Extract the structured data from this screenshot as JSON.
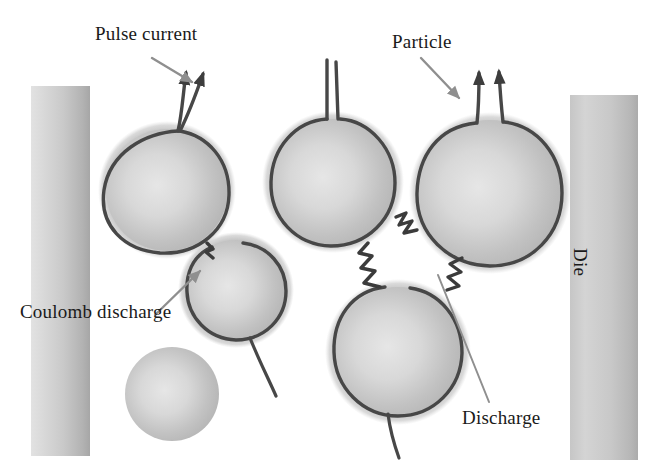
{
  "figure": {
    "width": 669,
    "height": 474,
    "background_color": "#ffffff"
  },
  "labels": {
    "pulse_current": "Pulse current",
    "particle": "Particle",
    "coulomb_discharge": "Coulomb discharge",
    "discharge": "Discharge",
    "die": "Die"
  },
  "colors": {
    "background": "#ffffff",
    "particle_fill_center": "#dedede",
    "particle_fill_edge": "#b6b6b6",
    "particle_halo": "#a8a8a8",
    "current_path": "#4a4a4a",
    "die_light": "#dcdcdc",
    "die_dark": "#a9a9a9",
    "label_text": "#1a1a1a",
    "arrow": "#8a8a8a"
  },
  "elements": {
    "dies": [
      {
        "name": "left-die",
        "x": 31,
        "y": 86,
        "width": 59,
        "height": 370
      },
      {
        "name": "right-die",
        "x": 570,
        "y": 95,
        "width": 68,
        "height": 365
      }
    ],
    "particles": [
      {
        "name": "particle-upper-left",
        "cx": 167,
        "cy": 190,
        "r": 62,
        "outlined": true
      },
      {
        "name": "particle-middle-small",
        "cx": 236,
        "cy": 290,
        "r": 51,
        "outlined": true
      },
      {
        "name": "particle-upper-center",
        "cx": 333,
        "cy": 182,
        "r": 64,
        "outlined": true
      },
      {
        "name": "particle-lower-center",
        "cx": 398,
        "cy": 352,
        "r": 66,
        "outlined": true
      },
      {
        "name": "particle-upper-right",
        "cx": 490,
        "cy": 193,
        "r": 74,
        "outlined": true
      },
      {
        "name": "particle-isolated",
        "cx": 172,
        "cy": 394,
        "r": 47,
        "outlined": false
      }
    ],
    "annotations": [
      {
        "name": "pulse-current-arrow",
        "from": [
          152,
          60
        ],
        "to": [
          196,
          87
        ],
        "type": "arrow"
      },
      {
        "name": "particle-arrow",
        "from": [
          420,
          60
        ],
        "to": [
          459,
          100
        ],
        "type": "arrow"
      },
      {
        "name": "coulomb-arrow",
        "from": [
          157,
          314
        ],
        "to": [
          201,
          272
        ],
        "type": "arrow"
      },
      {
        "name": "discharge-leader",
        "from": [
          489,
          404
        ],
        "to": [
          437,
          276
        ],
        "type": "line"
      }
    ]
  }
}
